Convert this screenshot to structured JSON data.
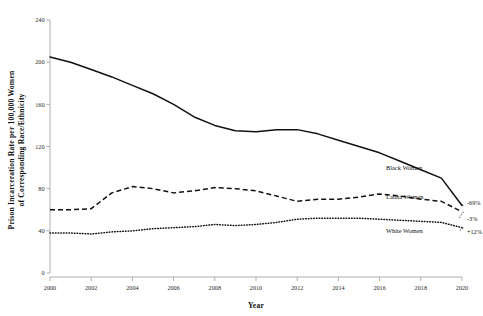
{
  "chart_data": {
    "type": "line",
    "title": "",
    "xlabel": "Year",
    "ylabel": "Prison Incarceration Rate per 100,000 Women of Corresponding Race/Ethnicity",
    "ylabel_line1": "Prison Incarceration Rate per 100,000 Women",
    "ylabel_line2": "of Corresponding Race/Ethnicity",
    "x": [
      2000,
      2001,
      2002,
      2003,
      2004,
      2005,
      2006,
      2007,
      2008,
      2009,
      2010,
      2011,
      2012,
      2013,
      2014,
      2015,
      2016,
      2017,
      2018,
      2019,
      2020
    ],
    "xlim": [
      2000,
      2020
    ],
    "ylim": [
      0,
      240
    ],
    "xticks": [
      2000,
      2002,
      2004,
      2006,
      2008,
      2010,
      2012,
      2014,
      2016,
      2018,
      2020
    ],
    "xticklabels": [
      "2000",
      "2002",
      "2004",
      "2006",
      "2008",
      "2010",
      "2012",
      "2014",
      "2016",
      "2018",
      "2020"
    ],
    "yticks": [
      0,
      40,
      80,
      120,
      160,
      200,
      240
    ],
    "yticklabels": [
      "0",
      "40",
      "80",
      "120",
      "160",
      "200",
      "240"
    ],
    "grid": false,
    "legend_position": "inline-right-of-series",
    "series": [
      {
        "name": "Black Women",
        "style": "solid",
        "color": "#111111",
        "label": "Black Women",
        "change_label": "-69%",
        "values": [
          205,
          200,
          193,
          186,
          178,
          170,
          160,
          148,
          140,
          135,
          134,
          136,
          136,
          132,
          126,
          120,
          114,
          106,
          98,
          90,
          64
        ]
      },
      {
        "name": "Latina Women",
        "style": "dashed",
        "color": "#111111",
        "label": "Latina Women",
        "change_label": "-3%",
        "values": [
          60,
          60,
          61,
          76,
          82,
          80,
          76,
          78,
          81,
          80,
          78,
          73,
          68,
          70,
          70,
          72,
          75,
          73,
          70,
          68,
          58
        ]
      },
      {
        "name": "White Women",
        "style": "dotted",
        "color": "#111111",
        "label": "White Women",
        "change_label": "+12%",
        "values": [
          38,
          38,
          37,
          39,
          40,
          42,
          43,
          44,
          46,
          45,
          46,
          48,
          51,
          52,
          52,
          52,
          51,
          50,
          49,
          48,
          43
        ]
      }
    ],
    "annotations": [
      {
        "text": "Black Women",
        "series": "Black Women"
      },
      {
        "text": "Latina Women",
        "series": "Latina Women"
      },
      {
        "text": "White Women",
        "series": "White Women"
      },
      {
        "text": "-69%",
        "series": "Black Women"
      },
      {
        "text": "-3%",
        "series": "Latina Women"
      },
      {
        "text": "+12%",
        "series": "White Women"
      }
    ]
  }
}
